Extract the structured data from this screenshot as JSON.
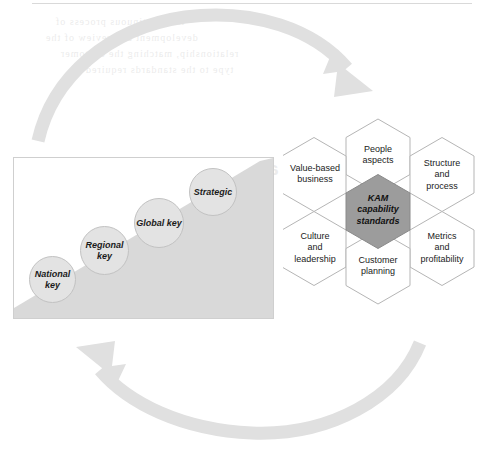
{
  "figure": {
    "background_color": "#ffffff",
    "ghost_text": {
      "note": "faint mirrored bleed-through text from the reverse printed page",
      "lines": [
        "is a continuous process of",
        "development and review of the",
        "relationship, matching the customer",
        "type to the standards required",
        "Key account customer types",
        "and KAM"
      ]
    }
  },
  "arrows": {
    "color": "#e0e0e0",
    "top": {
      "name": "clockwise-arrow-top",
      "direction": "left-to-right, arrowhead pointing down-right"
    },
    "bottom": {
      "name": "clockwise-arrow-bottom",
      "direction": "right-to-left, arrowhead pointing up-left"
    }
  },
  "staircase": {
    "panel_border_color": "#cfcfcf",
    "ramp_color": "#d9d9d9",
    "bubble_fill": "#e3e3e3",
    "bubble_border": "#c2c2c2",
    "steps": [
      {
        "label": "National\nkey",
        "level": 1
      },
      {
        "label": "Regional\nkey",
        "level": 2
      },
      {
        "label": "Global\nkey",
        "level": 3
      },
      {
        "label": "Strategic",
        "level": 4
      }
    ]
  },
  "hexagons": {
    "outline_color": "#b5b5b5",
    "center_fill": "#9c9c9c",
    "center": {
      "label": "KAM\ncapability\nstandards"
    },
    "petals": [
      {
        "label": "People\naspects",
        "position": "top"
      },
      {
        "label": "Structure\nand\nprocess",
        "position": "top-right"
      },
      {
        "label": "Metrics\nand\nprofitability",
        "position": "bottom-right"
      },
      {
        "label": "Customer\nplanning",
        "position": "bottom"
      },
      {
        "label": "Culture\nand\nleadership",
        "position": "bottom-left"
      },
      {
        "label": "Value-based\nbusiness",
        "position": "top-left"
      }
    ]
  }
}
